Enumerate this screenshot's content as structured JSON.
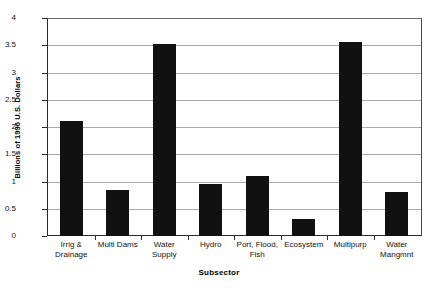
{
  "chart_data": {
    "type": "bar",
    "title": "",
    "xlabel": "Subsector",
    "ylabel": "Billions of 1996 U.S. Dollars",
    "categories": [
      "Irrig & Drainage",
      "Multi Dams",
      "Water Supply",
      "Hydro",
      "Port, Flood, Fish",
      "Ecosystem",
      "Multipurp",
      "Water Mangmnt"
    ],
    "category_lines": [
      [
        "Irrig &",
        "Drainage"
      ],
      [
        "Multi Dams",
        ""
      ],
      [
        "Water",
        "Supply"
      ],
      [
        "Hydro",
        ""
      ],
      [
        "Port, Flood,",
        "Fish"
      ],
      [
        "Ecosystem",
        ""
      ],
      [
        "Multipurp",
        ""
      ],
      [
        "Water",
        "Mangmnt"
      ]
    ],
    "values": [
      2.11,
      0.85,
      3.53,
      0.95,
      1.1,
      0.31,
      3.56,
      0.81
    ],
    "ylim": [
      0,
      4
    ],
    "ytick_values": [
      0,
      0.5,
      1,
      1.5,
      2,
      2.5,
      3,
      3.5,
      4
    ],
    "ytick_labels": [
      "0",
      "0.5",
      "1",
      "1.5",
      "2",
      "2.5",
      "3",
      "3.5",
      "4"
    ],
    "grid": true,
    "legend": false,
    "bar_color": "#111111",
    "grid_color": "#a9a9a9",
    "axis_color": "#2b2b2b"
  }
}
